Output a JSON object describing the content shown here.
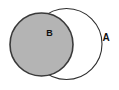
{
  "diagram": {
    "type": "venn",
    "background": "#ffffff",
    "set_a": {
      "label": "A",
      "fill": "#ffffff",
      "stroke": "#2e2e2e",
      "shaded": false,
      "label_position": "outside-right"
    },
    "set_b": {
      "label": "B",
      "fill": "#b4b4b4",
      "stroke": "#3a3a3a",
      "shaded": true,
      "label_position": "inside-upper-right"
    },
    "label_color": "#111111"
  }
}
